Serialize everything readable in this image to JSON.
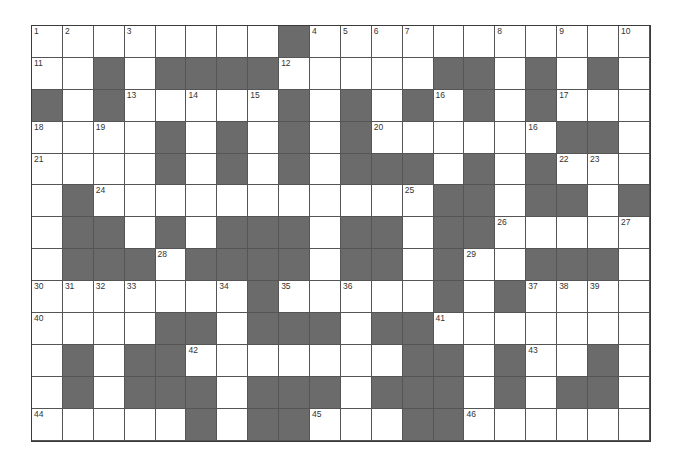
{
  "puzzle": {
    "rows": 13,
    "cols": 20,
    "colors": {
      "black_cell": "#6b6b6b",
      "white_cell": "#ffffff",
      "grid_line": "#555555"
    },
    "grid": [
      [
        "1",
        "2",
        ".",
        "3",
        ".",
        ".",
        ".",
        ".",
        "#",
        "4",
        "5",
        "6",
        "7",
        ".",
        ".",
        "8",
        ".",
        "9",
        ".",
        "10"
      ],
      [
        "11",
        ".",
        "#",
        ".",
        "#",
        "#",
        "#",
        "#",
        "12",
        ".",
        ".",
        ".",
        ".",
        "#",
        "#",
        ".",
        "#",
        ".",
        "#",
        "."
      ],
      [
        "#",
        ".",
        "#",
        "13",
        ".",
        "14",
        ".",
        "15",
        "#",
        ".",
        "#",
        ".",
        "#",
        "16",
        "#",
        ".",
        "#",
        "17",
        ".",
        "."
      ],
      [
        "18",
        ".",
        "19",
        ".",
        "#",
        ".",
        "#",
        ".",
        "#",
        ".",
        "#",
        "20",
        ".",
        ".",
        ".",
        ".",
        "16",
        "#",
        "#",
        "."
      ],
      [
        "21",
        ".",
        ".",
        ".",
        "#",
        ".",
        "#",
        ".",
        "#",
        ".",
        "#",
        "#",
        "#",
        ".",
        "#",
        ".",
        "#",
        "22",
        "23",
        "."
      ],
      [
        ".",
        "#",
        "24",
        ".",
        ".",
        ".",
        ".",
        ".",
        ".",
        ".",
        ".",
        ".",
        "25",
        "#",
        "#",
        ".",
        "#",
        "#",
        ".",
        "#"
      ],
      [
        ".",
        "#",
        "#",
        ".",
        "#",
        ".",
        "#",
        "#",
        "#",
        ".",
        "#",
        "#",
        ".",
        "#",
        "#",
        "26",
        ".",
        ".",
        ".",
        "27"
      ],
      [
        ".",
        "#",
        "#",
        "#",
        "28",
        "#",
        "#",
        "#",
        "#",
        ".",
        "#",
        "#",
        ".",
        "#",
        "29",
        ".",
        "#",
        "#",
        "#",
        "."
      ],
      [
        "30",
        "31",
        "32",
        "33",
        ".",
        ".",
        "34",
        "#",
        "35",
        ".",
        "36",
        ".",
        ".",
        "#",
        ".",
        "#",
        "37",
        "38",
        "39",
        "."
      ],
      [
        "40",
        ".",
        ".",
        ".",
        "#",
        "#",
        ".",
        "#",
        "#",
        "#",
        ".",
        "#",
        "#",
        "41",
        ".",
        ".",
        ".",
        ".",
        ".",
        "."
      ],
      [
        ".",
        "#",
        ".",
        "#",
        "#",
        "42",
        ".",
        ".",
        ".",
        ".",
        ".",
        ".",
        "#",
        "#",
        ".",
        "#",
        "43",
        ".",
        "#",
        "."
      ],
      [
        ".",
        "#",
        ".",
        "#",
        "#",
        "#",
        ".",
        "#",
        "#",
        "#",
        ".",
        "#",
        "#",
        "#",
        ".",
        "#",
        ".",
        "#",
        "#",
        "."
      ],
      [
        "44",
        ".",
        ".",
        ".",
        ".",
        "#",
        ".",
        "#",
        "#",
        "45",
        ".",
        ".",
        "#",
        "#",
        "46",
        ".",
        ".",
        ".",
        ".",
        "."
      ]
    ],
    "letters": {}
  }
}
